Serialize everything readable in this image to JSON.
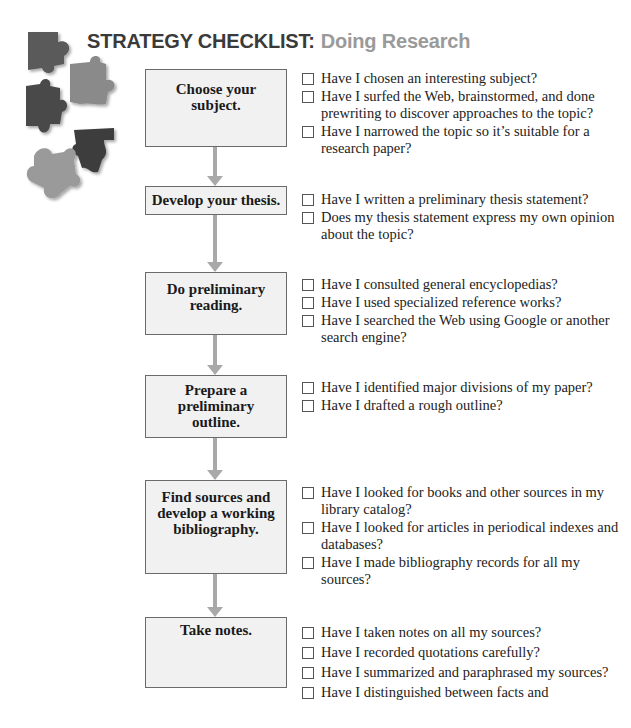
{
  "header": {
    "title_main": "STRATEGY CHECKLIST:",
    "title_sub": "Doing Research",
    "icon": "puzzle-pieces-icon"
  },
  "colors": {
    "title_main": "#3a3a3a",
    "title_sub": "#9a9a9a",
    "box_fill": "#f1f1f1",
    "arrow": "#a9a9a9"
  },
  "steps": [
    {
      "label": "Choose your subject.",
      "items": [
        "Have I chosen an interesting subject?",
        "Have I surfed the Web, brainstormed, and done prewriting to discover approaches to the topic?",
        "Have I narrowed the topic so it’s suitable for a research paper?"
      ]
    },
    {
      "label": "Develop your thesis.",
      "items": [
        "Have I written a preliminary thesis statement?",
        "Does my thesis statement express my own opinion about the topic?"
      ]
    },
    {
      "label": "Do preliminary reading.",
      "items": [
        "Have I consulted general encyclopedias?",
        "Have I used specialized reference works?",
        "Have I searched the Web using Google or another search engine?"
      ]
    },
    {
      "label": "Prepare a preliminary outline.",
      "items": [
        "Have I identified major divisions of my paper?",
        "Have I drafted a rough outline?"
      ]
    },
    {
      "label": "Find sources and develop a working bibliography.",
      "items": [
        "Have I looked for books and other sources in my library catalog?",
        "Have I looked for articles in periodical indexes and databases?",
        "Have I made bibliography records for all my sources?"
      ]
    },
    {
      "label": "Take notes.",
      "items": [
        "Have I taken notes on all my sources?",
        "Have I recorded quotations carefully?",
        "Have I summarized and paraphrased my sources?",
        "Have I distinguished between facts and"
      ]
    }
  ]
}
